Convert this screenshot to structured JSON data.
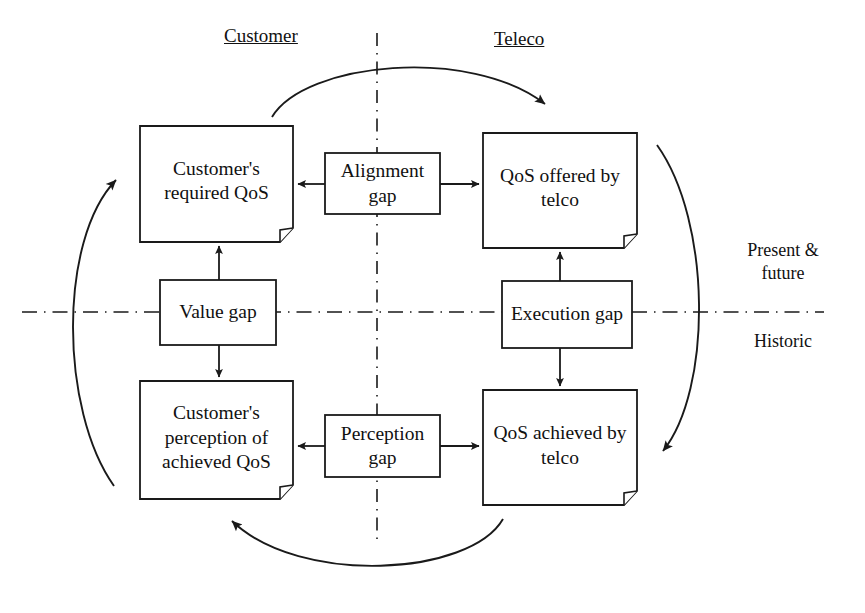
{
  "diagram": {
    "headers": {
      "left": "Customer",
      "right": "Teleco"
    },
    "side_labels": {
      "upper": "Present &\nfuture",
      "lower": "Historic"
    },
    "boxes": [
      {
        "id": "customer-required-qos",
        "label": "Customer's\nrequired\nQoS",
        "shape": "document",
        "quadrant": "top-left"
      },
      {
        "id": "qos-offered-by-telco",
        "label": "QoS offered by\ntelco",
        "shape": "document",
        "quadrant": "top-right"
      },
      {
        "id": "customer-perception-of-achieved-qos",
        "label": "Customer's\nperception\nof achieved\nQoS",
        "shape": "document",
        "quadrant": "bottom-left"
      },
      {
        "id": "qos-achieved-by-telco",
        "label": "QoS achieved\nby telco",
        "shape": "document",
        "quadrant": "bottom-right"
      }
    ],
    "gaps": [
      {
        "id": "alignment-gap",
        "label": "Alignment\ngap",
        "position": "top-center",
        "connects": [
          "customer-required-qos",
          "qos-offered-by-telco"
        ]
      },
      {
        "id": "value-gap",
        "label": "Value\ngap",
        "position": "middle-left",
        "connects": [
          "customer-required-qos",
          "customer-perception-of-achieved-qos"
        ]
      },
      {
        "id": "execution-gap",
        "label": "Execution\ngap",
        "position": "middle-right",
        "connects": [
          "qos-offered-by-telco",
          "qos-achieved-by-telco"
        ]
      },
      {
        "id": "perception-gap",
        "label": "Perception\ngap",
        "position": "bottom-center",
        "connects": [
          "customer-perception-of-achieved-qos",
          "qos-achieved-by-telco"
        ]
      }
    ],
    "cycle_arcs": [
      {
        "id": "arc-top",
        "from": "customer-required-qos",
        "to": "qos-offered-by-telco",
        "direction": "left-to-right"
      },
      {
        "id": "arc-right",
        "from": "qos-offered-by-telco",
        "to": "qos-achieved-by-telco",
        "direction": "top-to-bottom"
      },
      {
        "id": "arc-bottom",
        "from": "qos-achieved-by-telco",
        "to": "customer-perception-of-achieved-qos",
        "direction": "right-to-left"
      },
      {
        "id": "arc-left",
        "from": "customer-perception-of-achieved-qos",
        "to": "customer-required-qos",
        "direction": "bottom-to-top"
      }
    ],
    "divider_lines": {
      "vertical": "dash-dot",
      "horizontal": "dash-dot"
    },
    "colors": {
      "stroke": "#1a1a1a",
      "background": "#ffffff",
      "text": "#111111"
    }
  }
}
